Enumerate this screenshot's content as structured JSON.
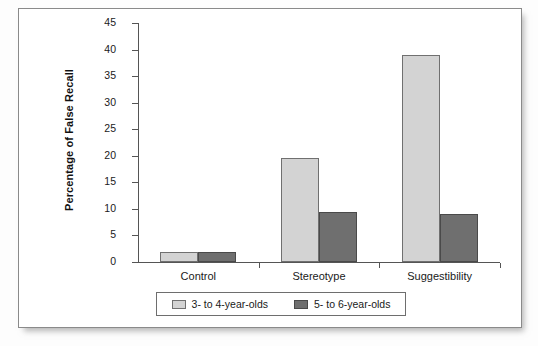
{
  "chart_data": {
    "type": "bar",
    "title": "",
    "subtitle": "",
    "xlabel": "",
    "ylabel": "Percentage of False Recall",
    "categories": [
      "Control",
      "Stereotype",
      "Suggestibility"
    ],
    "series": [
      {
        "name": "3- to 4-year-olds",
        "color": "#d3d3d3",
        "values": [
          1.8,
          19.5,
          39.0
        ]
      },
      {
        "name": "5- to 6-year-olds",
        "color": "#6f6f6f",
        "values": [
          1.8,
          9.4,
          9.0
        ]
      }
    ],
    "ylim": [
      0,
      45
    ],
    "ytick_step": 5,
    "yticks": [
      45,
      40,
      35,
      30,
      25,
      20,
      15,
      10,
      5,
      0
    ],
    "ytick_labels": [
      "45",
      "40",
      "35",
      "30",
      "25",
      "20",
      "15",
      "10",
      "5",
      "0"
    ],
    "grid": false,
    "legend_position": "bottom"
  },
  "figure": {
    "axis_color": "#555555",
    "frame_border_color": "#8a8a8a",
    "background": "#ffffff"
  }
}
